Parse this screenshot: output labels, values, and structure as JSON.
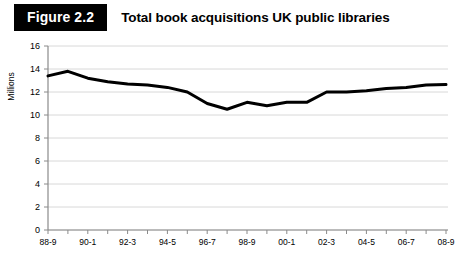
{
  "header": {
    "badge": "Figure 2.2",
    "title": "Total book acquisitions UK public libraries"
  },
  "chart_data": {
    "type": "line",
    "title": "Total book acquisitions UK public libraries",
    "xlabel": "",
    "ylabel": "Millions",
    "ylim": [
      0,
      16
    ],
    "ytick_values": [
      0,
      2,
      4,
      6,
      8,
      10,
      12,
      14,
      16
    ],
    "ytick_labels": [
      "0",
      "2",
      "4",
      "6",
      "8",
      "10",
      "12",
      "14",
      "16"
    ],
    "grid": "horizontal",
    "legend": "none",
    "line_color": "#000000",
    "grid_color": "#d8d8d8",
    "axis_color": "#8a8a8a",
    "categories": [
      "88-9",
      "89-0",
      "90-1",
      "91-2",
      "92-3",
      "93-4",
      "94-5",
      "95-6",
      "96-7",
      "97-8",
      "98-9",
      "99-0",
      "00-1",
      "01-2",
      "02-3",
      "03-4",
      "04-5",
      "05-6",
      "06-7",
      "07-8",
      "08-9"
    ],
    "xtick_labels_shown": [
      "88-9",
      "90-1",
      "92-3",
      "94-5",
      "96-7",
      "98-9",
      "00-1",
      "02-3",
      "04-5",
      "06-7",
      "08-9"
    ],
    "values": [
      13.4,
      13.8,
      13.2,
      12.9,
      12.7,
      12.6,
      12.4,
      12.0,
      11.0,
      10.5,
      11.1,
      10.8,
      11.1,
      11.1,
      12.0,
      12.0,
      12.1,
      12.3,
      12.4,
      12.6,
      12.65
    ]
  }
}
